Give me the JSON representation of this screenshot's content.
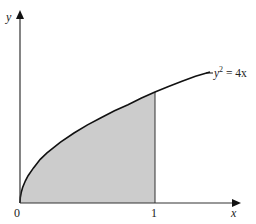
{
  "diagram": {
    "curve_label": "y",
    "curve_label_sup": "2",
    "curve_label_rhs": " = 4x",
    "x_axis_label": "x",
    "y_axis_label": "y",
    "origin_label": "0",
    "x_tick_label": "1",
    "equation": "y^2 = 4x",
    "shaded_region": "area under y = 2√x from x = 0 to x = 1",
    "colors": {
      "axis": "#333333",
      "curve": "#111111",
      "shade": "#cccccc",
      "background": "#ffffff"
    }
  }
}
